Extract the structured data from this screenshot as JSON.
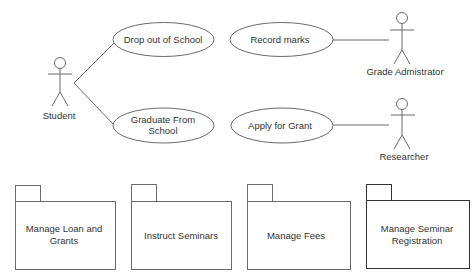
{
  "diagram": {
    "type": "uml-use-case",
    "colors": {
      "stroke": "#6a6a6a",
      "stroke_dark": "#333333",
      "text": "#333333",
      "background": "#ffffff"
    },
    "actors": [
      {
        "id": "student",
        "label": "Student",
        "x": 60,
        "y": 63
      },
      {
        "id": "grade-administrator",
        "label": "Grade Admistrator",
        "x": 402,
        "y": 18
      },
      {
        "id": "researcher",
        "label": "Researcher",
        "x": 402,
        "y": 104
      }
    ],
    "use_cases": [
      {
        "id": "drop-out",
        "lines": [
          "Drop out of School"
        ],
        "cx": 163,
        "cy": 40
      },
      {
        "id": "graduate",
        "lines": [
          "Graduate From",
          "School"
        ],
        "cx": 163,
        "cy": 125
      },
      {
        "id": "record-marks",
        "lines": [
          "Record marks"
        ],
        "cx": 282,
        "cy": 40
      },
      {
        "id": "apply-grant",
        "lines": [
          "Apply for Grant"
        ],
        "cx": 282,
        "cy": 125
      }
    ],
    "associations": [
      {
        "from": "student",
        "to": "drop-out"
      },
      {
        "from": "student",
        "to": "graduate"
      },
      {
        "from": "record-marks",
        "to": "grade-administrator"
      },
      {
        "from": "apply-grant",
        "to": "researcher"
      }
    ],
    "packages": [
      {
        "id": "manage-loan",
        "lines": [
          "Manage Loan and",
          "Grants"
        ],
        "x": 15
      },
      {
        "id": "instruct-seminars",
        "lines": [
          "Instruct Seminars"
        ],
        "x": 131
      },
      {
        "id": "manage-fees",
        "lines": [
          "Manage Fees"
        ],
        "x": 247
      },
      {
        "id": "manage-seminar-registration",
        "lines": [
          "Manage Seminar",
          "Registration"
        ],
        "x": 366
      }
    ]
  }
}
